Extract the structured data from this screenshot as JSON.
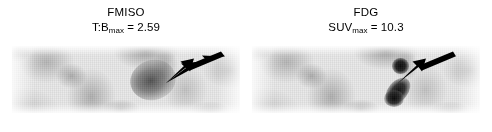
{
  "figure": {
    "type": "pet-scan-comparison",
    "background_color": "#ffffff",
    "arrow_color": "#000000",
    "panel_count": 2
  },
  "panels": [
    {
      "id": "fmiso",
      "title": "FMISO",
      "metric_prefix": "T:B",
      "metric_subscript": "max",
      "metric_separator": " = ",
      "metric_value": "2.59",
      "metric_full": "T:Bmax = 2.59",
      "arrow": {
        "name": "annotation-arrow",
        "direction": "down-left",
        "points_to": "hypoxic-uptake-focus"
      },
      "foci": [
        {
          "name": "diffuse-uptake-region",
          "intensity": "moderate"
        }
      ]
    },
    {
      "id": "fdg",
      "title": "FDG",
      "metric_prefix": "SUV",
      "metric_subscript": "max",
      "metric_separator": " = ",
      "metric_value": "10.3",
      "metric_full": "SUVmax = 10.3",
      "arrow": {
        "name": "annotation-arrow",
        "direction": "down-left",
        "points_to": "hypermetabolic-focus"
      },
      "foci": [
        {
          "name": "focal-node",
          "intensity": "intense"
        },
        {
          "name": "elongated-streak",
          "intensity": "intense"
        }
      ]
    }
  ]
}
